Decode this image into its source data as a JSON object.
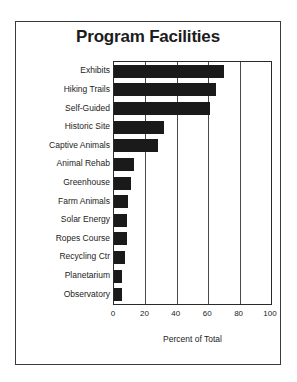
{
  "frame": {
    "border_color": "#3a3a3a",
    "background": "#ffffff"
  },
  "chart_data": {
    "type": "bar",
    "orientation": "horizontal",
    "title": "Program Facilities",
    "xlabel": "Percent of Total",
    "ylabel": "",
    "xlim": [
      0,
      100
    ],
    "xticks": [
      "0",
      "20",
      "40",
      "60",
      "80",
      "100"
    ],
    "grid": true,
    "grid_axis": "x",
    "legend": false,
    "bar_color": "#1a1a1a",
    "categories": [
      "Exhibits",
      "Hiking Trails",
      "Self-Guided",
      "Historic Site",
      "Captive Animals",
      "Animal Rehab",
      "Greenhouse",
      "Farm Animals",
      "Solar Energy",
      "Ropes Course",
      "Recycling Ctr",
      "Planetarium",
      "Observatory"
    ],
    "values": [
      70,
      65,
      61,
      32,
      28,
      13,
      11,
      9,
      8,
      8,
      7,
      5,
      5
    ]
  }
}
